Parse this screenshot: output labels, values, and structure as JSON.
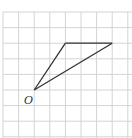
{
  "diagram": {
    "type": "grid-triangle",
    "grid": {
      "columns": 8,
      "rows": 8,
      "origin_px": [
        3,
        12
      ],
      "cell_px": 15.6,
      "line_color": "#d4d4d4"
    },
    "points": {
      "O": {
        "label": "O",
        "grid": [
          2,
          5
        ]
      },
      "A": {
        "label": "",
        "grid": [
          4,
          2
        ]
      },
      "B": {
        "label": "",
        "grid": [
          7,
          2
        ]
      }
    },
    "segments": [
      [
        "O",
        "A"
      ],
      [
        "A",
        "B"
      ],
      [
        "O",
        "B"
      ]
    ],
    "stroke_color": "#333333",
    "labels": {
      "origin": "O"
    }
  }
}
